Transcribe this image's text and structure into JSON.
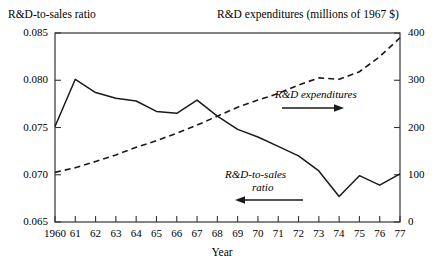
{
  "header": {
    "left_title": "R&D-to-sales ratio",
    "right_title": "R&D expenditures (millions of 1967 $)"
  },
  "axes": {
    "xlabel": "Year",
    "y_left_ticks": [
      "0.085",
      "0.080",
      "0.075",
      "0.070",
      "0.065"
    ],
    "y_right_ticks": [
      "400",
      "300",
      "200",
      "100",
      "0"
    ],
    "x_ticks": [
      "1960",
      "61",
      "62",
      "63",
      "64",
      "65",
      "66",
      "67",
      "68",
      "69",
      "70",
      "71",
      "72",
      "73",
      "74",
      "75",
      "76",
      "77"
    ]
  },
  "annotations": {
    "expenditures_label": "R&D expenditures",
    "ratio_label_line1": "R&D-to-sales",
    "ratio_label_line2": "ratio",
    "expenditures_arrow": "arrow-right",
    "ratio_arrow": "arrow-left"
  },
  "colors": {
    "line": "#1a1a1a",
    "axis": "#333333",
    "background": "#ffffff"
  },
  "chart_data": {
    "type": "line",
    "title": "",
    "xlabel": "Year",
    "x": [
      1960,
      1961,
      1962,
      1963,
      1964,
      1965,
      1966,
      1967,
      1968,
      1969,
      1970,
      1971,
      1972,
      1973,
      1974,
      1975,
      1976,
      1977
    ],
    "x_tick_labels": [
      "1960",
      "61",
      "62",
      "63",
      "64",
      "65",
      "66",
      "67",
      "68",
      "69",
      "70",
      "71",
      "72",
      "73",
      "74",
      "75",
      "76",
      "77"
    ],
    "grid": false,
    "legend": "inline-annotations",
    "series": [
      {
        "name": "R&D-to-sales ratio",
        "style": "solid",
        "axis": "left",
        "ylabel": "R&D-to-sales ratio",
        "ylim": [
          0.065,
          0.085
        ],
        "ytick_values": [
          0.065,
          0.07,
          0.075,
          0.08,
          0.085
        ],
        "values": [
          0.0751,
          0.0801,
          0.0787,
          0.0781,
          0.0778,
          0.0767,
          0.0765,
          0.0779,
          0.0762,
          0.0748,
          0.074,
          0.073,
          0.072,
          0.0704,
          0.0677,
          0.0699,
          0.0689,
          0.0701
        ]
      },
      {
        "name": "R&D expenditures",
        "style": "dashed",
        "axis": "right",
        "ylabel": "R&D expenditures (millions of 1967 $)",
        "ylim": [
          0,
          400
        ],
        "ytick_values": [
          0,
          100,
          200,
          300,
          400
        ],
        "values": [
          105,
          115,
          128,
          142,
          158,
          172,
          188,
          205,
          224,
          243,
          258,
          272,
          290,
          305,
          302,
          318,
          350,
          390
        ]
      }
    ]
  }
}
